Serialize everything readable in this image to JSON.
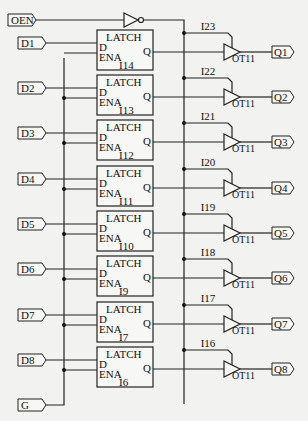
{
  "diagram": {
    "type": "schematic",
    "title": "",
    "inputs": {
      "oen": "OEN",
      "gate": "G",
      "data": [
        "D1",
        "D2",
        "D3",
        "D4",
        "D5",
        "D6",
        "D7",
        "D8"
      ]
    },
    "outputs": [
      "Q1",
      "Q2",
      "Q3",
      "Q4",
      "Q5",
      "Q6",
      "Q7",
      "Q8"
    ],
    "latch": {
      "title": "LATCH",
      "pin_d": "D",
      "pin_ena": "ENA",
      "pin_q": "Q",
      "instances": [
        "I14",
        "I13",
        "I12",
        "I11",
        "I10",
        "I9",
        "I7",
        "I6"
      ]
    },
    "buffer": {
      "type_label": "OT11",
      "instances": [
        "I23",
        "I22",
        "I21",
        "I20",
        "I19",
        "I18",
        "I17",
        "I16"
      ]
    },
    "inverter": {
      "name": "OEN inverter"
    }
  }
}
